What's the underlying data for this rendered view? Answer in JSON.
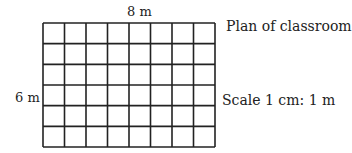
{
  "diagram": {
    "title": "Plan of classroom",
    "scale": "Scale 1 cm: 1 m",
    "width_label": "8 m",
    "height_label": "6 m",
    "grid": {
      "columns": 8,
      "rows": 6,
      "line_color": "#222222"
    }
  }
}
